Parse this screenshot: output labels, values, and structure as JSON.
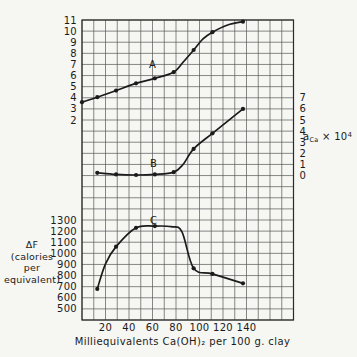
{
  "chart_data": {
    "type": "line",
    "title": "",
    "xlabel": "Milliequivalents Ca(OH)₂ per 100 g. clay",
    "x_axis": {
      "label": "Milliequivalents Ca(OH)₂ per 100 g. clay",
      "min": 0,
      "max": 180,
      "grid_step": 10,
      "tick_labels": [
        20,
        40,
        60,
        80,
        100,
        120,
        140
      ]
    },
    "grid": {
      "on": true,
      "rows": 27,
      "cols": 18
    },
    "axes": {
      "A": {
        "side": "left",
        "title": "",
        "tick_labels": [
          11,
          10,
          9,
          8,
          7,
          6,
          5,
          4,
          3,
          2
        ],
        "first_row": 0,
        "units_per_row": 1,
        "range": [
          2,
          11
        ]
      },
      "B": {
        "side": "right",
        "title_parts": {
          "base": "a",
          "sub": "Ca",
          "mid": " × 10",
          "sup": "4"
        },
        "tick_labels": [
          7,
          6,
          5,
          4,
          3,
          2,
          1,
          0
        ],
        "first_row": 7,
        "units_per_row": 1,
        "range": [
          0,
          7
        ]
      },
      "C": {
        "side": "left",
        "title_lines": "ΔF\n(calories\nper\nequivalent)",
        "tick_labels": [
          1300,
          1200,
          1100,
          1000,
          900,
          800,
          700,
          600,
          500
        ],
        "first_row": 18,
        "units_per_row": 100,
        "range": [
          500,
          1300
        ]
      }
    },
    "series": [
      {
        "name": "A",
        "axis": "A",
        "curve_label": {
          "text": "A",
          "x": 60,
          "value": 6.95
        },
        "points": [
          {
            "x": 0,
            "value": 3.6,
            "marker": true
          },
          {
            "x": 13,
            "value": 4.05,
            "marker": true
          },
          {
            "x": 29,
            "value": 4.65,
            "marker": true
          },
          {
            "x": 46,
            "value": 5.3,
            "marker": true
          },
          {
            "x": 62,
            "value": 5.75,
            "marker": true
          },
          {
            "x": 78,
            "value": 6.3,
            "marker": true
          },
          {
            "x": 86,
            "value": 7.2,
            "marker": false
          },
          {
            "x": 95,
            "value": 8.3,
            "marker": true
          },
          {
            "x": 103,
            "value": 9.3,
            "marker": false
          },
          {
            "x": 111,
            "value": 9.9,
            "marker": true
          },
          {
            "x": 124,
            "value": 10.55,
            "marker": false
          },
          {
            "x": 137,
            "value": 10.85,
            "marker": true
          }
        ]
      },
      {
        "name": "B",
        "axis": "B",
        "curve_label": {
          "text": "B",
          "x": 61,
          "value": 1.05
        },
        "points": [
          {
            "x": 13,
            "value": 0.25,
            "marker": true
          },
          {
            "x": 29,
            "value": 0.1,
            "marker": true
          },
          {
            "x": 46,
            "value": 0.05,
            "marker": true
          },
          {
            "x": 62,
            "value": 0.1,
            "marker": true
          },
          {
            "x": 78,
            "value": 0.3,
            "marker": true
          },
          {
            "x": 86,
            "value": 1.0,
            "marker": false
          },
          {
            "x": 95,
            "value": 2.4,
            "marker": true
          },
          {
            "x": 111,
            "value": 3.8,
            "marker": true
          },
          {
            "x": 137,
            "value": 6.0,
            "marker": true
          }
        ]
      },
      {
        "name": "C",
        "axis": "C",
        "curve_label": {
          "text": "C",
          "x": 61,
          "value": 1290
        },
        "points": [
          {
            "x": 13,
            "value": 680,
            "marker": true
          },
          {
            "x": 20,
            "value": 905,
            "marker": false
          },
          {
            "x": 29,
            "value": 1060,
            "marker": true
          },
          {
            "x": 46,
            "value": 1230,
            "marker": true
          },
          {
            "x": 62,
            "value": 1245,
            "marker": true
          },
          {
            "x": 76,
            "value": 1240,
            "marker": false
          },
          {
            "x": 85,
            "value": 1195,
            "marker": false
          },
          {
            "x": 95,
            "value": 865,
            "marker": true
          },
          {
            "x": 111,
            "value": 815,
            "marker": true
          },
          {
            "x": 137,
            "value": 730,
            "marker": true
          }
        ]
      }
    ],
    "style": {
      "background": "#f6f6f3",
      "grid_color": "#565656",
      "border_color": "#2a2a2a",
      "curve_color": "#1b1b1b",
      "text_color": "#1b1b1b"
    }
  }
}
